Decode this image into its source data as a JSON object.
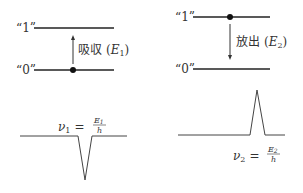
{
  "absorption": {
    "level1_label": "“1”",
    "level0_label": "“0”",
    "process_label": "吸収",
    "energy_symbol": "E",
    "energy_sub": "1",
    "formula": {
      "lhs": "ν",
      "lhs_sub": "1",
      "num": "E",
      "num_sub": "1",
      "den": "h"
    }
  },
  "emission": {
    "level1_label": "“1”",
    "level0_label": "“0”",
    "process_label": "放出",
    "energy_symbol": "E",
    "energy_sub": "2",
    "formula": {
      "lhs": "ν",
      "lhs_sub": "2",
      "num": "E",
      "num_sub": "2",
      "den": "h"
    }
  },
  "equals": "=",
  "paren_open": "(",
  "paren_close": ")"
}
